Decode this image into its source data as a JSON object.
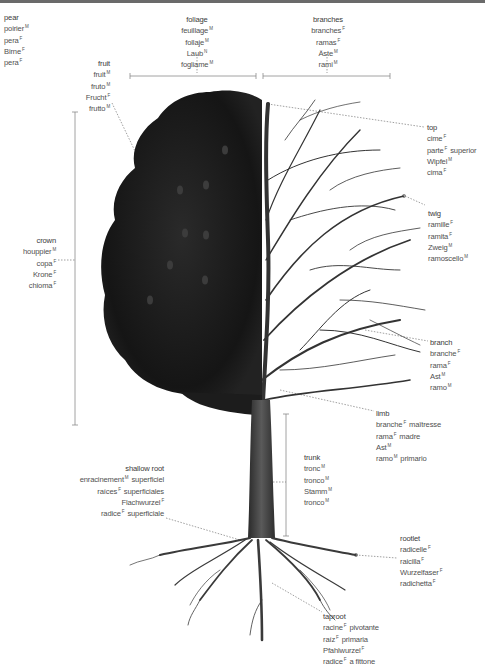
{
  "title": {
    "en": "pear",
    "fr": "poirier",
    "fr_g": "M",
    "es": "pera",
    "es_g": "F",
    "de": "Birne",
    "de_g": "F",
    "it": "pera",
    "it_g": "F"
  },
  "labels": {
    "foliage": {
      "rows": [
        {
          "t": "foliage",
          "g": ""
        },
        {
          "t": "feuillage",
          "g": "M"
        },
        {
          "t": "follaje",
          "g": "M"
        },
        {
          "t": "Laub",
          "g": "N"
        },
        {
          "t": "fogliame",
          "g": "M"
        }
      ]
    },
    "branches": {
      "rows": [
        {
          "t": "branches",
          "g": ""
        },
        {
          "t": "branches",
          "g": "F"
        },
        {
          "t": "ramas",
          "g": "F"
        },
        {
          "t": "Äste",
          "g": "M"
        },
        {
          "t": "rami",
          "g": "M"
        }
      ]
    },
    "fruit": {
      "rows": [
        {
          "t": "fruit",
          "g": ""
        },
        {
          "t": "fruit",
          "g": "M"
        },
        {
          "t": "fruto",
          "g": "M"
        },
        {
          "t": "Frucht",
          "g": "F"
        },
        {
          "t": "frutto",
          "g": "M"
        }
      ]
    },
    "top": {
      "rows": [
        {
          "t": "top",
          "g": ""
        },
        {
          "t": "cime",
          "g": "F"
        },
        {
          "t": "parte",
          "g": "F",
          "s": "superior"
        },
        {
          "t": "Wipfel",
          "g": "M"
        },
        {
          "t": "cima",
          "g": "F"
        }
      ]
    },
    "twig": {
      "rows": [
        {
          "t": "twig",
          "g": ""
        },
        {
          "t": "ramille",
          "g": "F"
        },
        {
          "t": "ramita",
          "g": "F"
        },
        {
          "t": "Zweig",
          "g": "M"
        },
        {
          "t": "ramoscello",
          "g": "M"
        }
      ]
    },
    "crown": {
      "rows": [
        {
          "t": "crown",
          "g": ""
        },
        {
          "t": "houppier",
          "g": "M"
        },
        {
          "t": "copa",
          "g": "F"
        },
        {
          "t": "Krone",
          "g": "F"
        },
        {
          "t": "chioma",
          "g": "F"
        }
      ]
    },
    "branch": {
      "rows": [
        {
          "t": "branch",
          "g": ""
        },
        {
          "t": "branche",
          "g": "F"
        },
        {
          "t": "rama",
          "g": "F"
        },
        {
          "t": "Ast",
          "g": "M"
        },
        {
          "t": "ramo",
          "g": "M"
        }
      ]
    },
    "limb": {
      "rows": [
        {
          "t": "limb",
          "g": ""
        },
        {
          "t": "branche",
          "g": "F",
          "s": "maîtresse"
        },
        {
          "t": "rama",
          "g": "F",
          "s": "madre"
        },
        {
          "t": "Ast",
          "g": "M"
        },
        {
          "t": "ramo",
          "g": "M",
          "s": "primario"
        }
      ]
    },
    "trunk": {
      "rows": [
        {
          "t": "trunk",
          "g": ""
        },
        {
          "t": "tronc",
          "g": "M"
        },
        {
          "t": "tronco",
          "g": "M"
        },
        {
          "t": "Stamm",
          "g": "M"
        },
        {
          "t": "tronco",
          "g": "M"
        }
      ]
    },
    "shallow_root": {
      "rows": [
        {
          "t": "shallow root",
          "g": ""
        },
        {
          "t": "enracinement",
          "g": "M",
          "s": "superficiel"
        },
        {
          "t": "raíces",
          "g": "F",
          "s": "superficiales"
        },
        {
          "t": "Flachwurzel",
          "g": "F"
        },
        {
          "t": "radice",
          "g": "F",
          "s": "superficiale"
        }
      ]
    },
    "rootlet": {
      "rows": [
        {
          "t": "rootlet",
          "g": ""
        },
        {
          "t": "radicelle",
          "g": "F"
        },
        {
          "t": "raicilla",
          "g": "F"
        },
        {
          "t": "Wurzelfaser",
          "g": "F"
        },
        {
          "t": "radichetta",
          "g": "F"
        }
      ]
    },
    "taproot": {
      "rows": [
        {
          "t": "taproot",
          "g": ""
        },
        {
          "t": "racine",
          "g": "F",
          "s": "pivotante"
        },
        {
          "t": "raíz",
          "g": "F",
          "s": "primaria"
        },
        {
          "t": "Pfahlwurzel",
          "g": "F"
        },
        {
          "t": "radice",
          "g": "F",
          "s": "a fittone"
        }
      ]
    }
  },
  "colors": {
    "text": "#505050",
    "line": "#8a8a8a",
    "foliage": "#1e1e1e",
    "trunk": "#3a3a3a",
    "topbar": "#6a6a6a"
  }
}
